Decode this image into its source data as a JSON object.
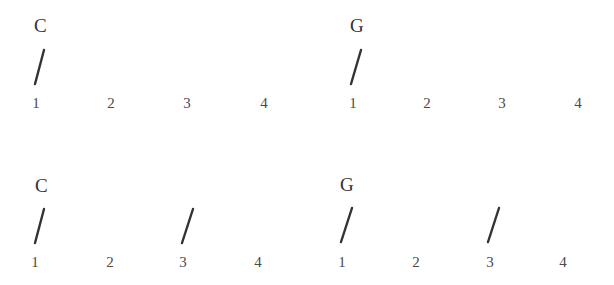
{
  "sheet": {
    "rows": [
      {
        "measures": [
          {
            "chord": "C",
            "beats": [
              "1",
              "2",
              "3",
              "4"
            ],
            "strums_on_beats": [
              1
            ]
          },
          {
            "chord": "G",
            "beats": [
              "1",
              "2",
              "3",
              "4"
            ],
            "strums_on_beats": [
              1
            ]
          }
        ]
      },
      {
        "measures": [
          {
            "chord": "C",
            "beats": [
              "1",
              "2",
              "3",
              "4"
            ],
            "strums_on_beats": [
              1,
              3
            ]
          },
          {
            "chord": "G",
            "beats": [
              "1",
              "2",
              "3",
              "4"
            ],
            "strums_on_beats": [
              1,
              3
            ]
          }
        ]
      }
    ],
    "strum_symbol": "slash-strum-mark",
    "colors": {
      "ink": "#333333",
      "beat_numbers": "#4a4a4a",
      "background": "#ffffff"
    }
  }
}
